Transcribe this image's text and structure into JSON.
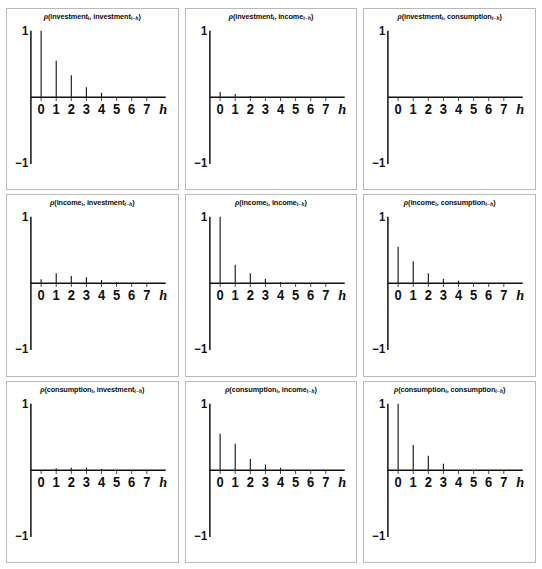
{
  "figure": {
    "type": "stem-plot-matrix",
    "rows": 3,
    "cols": 3,
    "axis_name": "h",
    "y_top_label": "1",
    "y_bottom_label": "−1",
    "x_ticks": [
      "0",
      "1",
      "2",
      "3",
      "4",
      "5",
      "6",
      "7"
    ],
    "ylim": [
      -1,
      1
    ],
    "xlim": [
      -0.6,
      7.8
    ],
    "line_color": "#1a1a1a",
    "border_color": "#b9b9b9",
    "background": "#ffffff"
  },
  "chart_data": [
    {
      "type": "bar",
      "title": "ρ(investment_t, investment_{t−h})",
      "title_parts": {
        "rho": "ρ",
        "open": "(",
        "var1": "investment",
        "sub1": "t",
        "sep": ", ",
        "var2": "investment",
        "sub2": "t−h",
        "close": ")"
      },
      "xlabel": "h",
      "ylabel": "",
      "categories": [
        0,
        1,
        2,
        3,
        4,
        5,
        6,
        7
      ],
      "values": [
        1.0,
        0.55,
        0.33,
        0.15,
        0.07,
        0.0,
        0.0,
        0.0
      ],
      "ylim": [
        -1,
        1
      ],
      "grid": false,
      "legend": "none"
    },
    {
      "type": "bar",
      "title": "ρ(investment_t, income_{t−h})",
      "title_parts": {
        "rho": "ρ",
        "open": "(",
        "var1": "investment",
        "sub1": "t",
        "sep": ", ",
        "var2": "income",
        "sub2": "t−h",
        "close": ")"
      },
      "xlabel": "h",
      "ylabel": "",
      "categories": [
        0,
        1,
        2,
        3,
        4,
        5,
        6,
        7
      ],
      "values": [
        0.08,
        0.05,
        0.02,
        0.01,
        0.0,
        0.0,
        0.0,
        0.0
      ],
      "ylim": [
        -1,
        1
      ],
      "grid": false,
      "legend": "none"
    },
    {
      "type": "bar",
      "title": "ρ(investment_t, consumption_{t−h})",
      "title_parts": {
        "rho": "ρ",
        "open": "(",
        "var1": "investment",
        "sub1": "t",
        "sep": ", ",
        "var2": "consumption",
        "sub2": "t−h",
        "close": ")"
      },
      "xlabel": "h",
      "ylabel": "",
      "categories": [
        0,
        1,
        2,
        3,
        4,
        5,
        6,
        7
      ],
      "values": [
        0.0,
        0.0,
        0.0,
        0.0,
        0.0,
        0.0,
        0.0,
        0.0
      ],
      "ylim": [
        -1,
        1
      ],
      "grid": false,
      "legend": "none"
    },
    {
      "type": "bar",
      "title": "ρ(income_t, investment_{t−h})",
      "title_parts": {
        "rho": "ρ",
        "open": "(",
        "var1": "income",
        "sub1": "t",
        "sep": ", ",
        "var2": "investment",
        "sub2": "t−h",
        "close": ")"
      },
      "xlabel": "h",
      "ylabel": "",
      "categories": [
        0,
        1,
        2,
        3,
        4,
        5,
        6,
        7
      ],
      "values": [
        0.06,
        0.15,
        0.11,
        0.09,
        0.05,
        0.02,
        0.0,
        0.0
      ],
      "ylim": [
        -1,
        1
      ],
      "grid": false,
      "legend": "none"
    },
    {
      "type": "bar",
      "title": "ρ(income_t, income_{t−h})",
      "title_parts": {
        "rho": "ρ",
        "open": "(",
        "var1": "income",
        "sub1": "t",
        "sep": ", ",
        "var2": "income",
        "sub2": "t−h",
        "close": ")"
      },
      "xlabel": "h",
      "ylabel": "",
      "categories": [
        0,
        1,
        2,
        3,
        4,
        5,
        6,
        7
      ],
      "values": [
        1.0,
        0.28,
        0.15,
        0.07,
        0.02,
        0.0,
        0.0,
        0.0
      ],
      "ylim": [
        -1,
        1
      ],
      "grid": false,
      "legend": "none"
    },
    {
      "type": "bar",
      "title": "ρ(income_t, consumption_{t−h})",
      "title_parts": {
        "rho": "ρ",
        "open": "(",
        "var1": "income",
        "sub1": "t",
        "sep": ", ",
        "var2": "consumption",
        "sub2": "t−h",
        "close": ")"
      },
      "xlabel": "h",
      "ylabel": "",
      "categories": [
        0,
        1,
        2,
        3,
        4,
        5,
        6,
        7
      ],
      "values": [
        0.55,
        0.33,
        0.15,
        0.07,
        0.04,
        0.0,
        0.0,
        0.0
      ],
      "ylim": [
        -1,
        1
      ],
      "grid": false,
      "legend": "none"
    },
    {
      "type": "bar",
      "title": "ρ(consumption_t, investment_{t−h})",
      "title_parts": {
        "rho": "ρ",
        "open": "(",
        "var1": "consumption",
        "sub1": "t",
        "sep": ", ",
        "var2": "investment",
        "sub2": "t−h",
        "close": ")"
      },
      "xlabel": "h",
      "ylabel": "",
      "categories": [
        0,
        1,
        2,
        3,
        4,
        5,
        6,
        7
      ],
      "values": [
        0.0,
        0.03,
        0.04,
        0.04,
        0.02,
        0.0,
        0.0,
        0.0
      ],
      "ylim": [
        -1,
        1
      ],
      "grid": false,
      "legend": "none"
    },
    {
      "type": "bar",
      "title": "ρ(consumption_t, income_{t−h})",
      "title_parts": {
        "rho": "ρ",
        "open": "(",
        "var1": "consumption",
        "sub1": "t",
        "sep": ", ",
        "var2": "income",
        "sub2": "t−h",
        "close": ")"
      },
      "xlabel": "h",
      "ylabel": "",
      "categories": [
        0,
        1,
        2,
        3,
        4,
        5,
        6,
        7
      ],
      "values": [
        0.55,
        0.4,
        0.17,
        0.09,
        0.04,
        0.0,
        0.0,
        0.0
      ],
      "ylim": [
        -1,
        1
      ],
      "grid": false,
      "legend": "none"
    },
    {
      "type": "bar",
      "title": "ρ(consumption_t, consumption_{t−h})",
      "title_parts": {
        "rho": "ρ",
        "open": "(",
        "var1": "consumption",
        "sub1": "t",
        "sep": ", ",
        "var2": "consumption",
        "sub2": "t−h",
        "close": ")"
      },
      "xlabel": "h",
      "ylabel": "",
      "categories": [
        0,
        1,
        2,
        3,
        4,
        5,
        6,
        7
      ],
      "values": [
        1.0,
        0.38,
        0.22,
        0.1,
        0.0,
        0.0,
        0.0,
        0.0
      ],
      "ylim": [
        -1,
        1
      ],
      "grid": false,
      "legend": "none"
    }
  ]
}
